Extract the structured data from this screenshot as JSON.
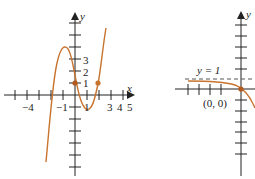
{
  "colors": {
    "axis": "#222222",
    "curve": "#c8732e",
    "dashed": "#555555"
  },
  "left_graph": {
    "y_axis_label": "y",
    "x_axis_label": "x",
    "x_tick_labels": [
      "−4",
      "−1",
      "1",
      "3",
      "4",
      "5"
    ],
    "y_tick_labels": [
      "3",
      "2",
      "1"
    ],
    "points": [
      "(0, 1)",
      "(2, 1)"
    ]
  },
  "right_graph": {
    "y_axis_label": "y",
    "asymptote_label": "y = 1",
    "point_label": "(0, 0)"
  }
}
